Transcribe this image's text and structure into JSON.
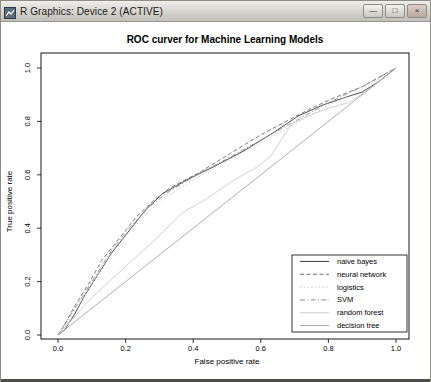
{
  "window": {
    "title": "R Graphics: Device 2 (ACTIVE)",
    "controls": [
      {
        "name": "minimize",
        "glyph": "—"
      },
      {
        "name": "maximize",
        "glyph": "□"
      },
      {
        "name": "close",
        "glyph": "×"
      }
    ]
  },
  "chart_data": {
    "type": "line",
    "title": "ROC curver for Machine Learning Models",
    "xlabel": "False positive rate",
    "ylabel": "True positive rate",
    "xlim": [
      0,
      1
    ],
    "ylim": [
      0,
      1
    ],
    "xticks": [
      "0.0",
      "0.2",
      "0.4",
      "0.6",
      "0.8",
      "1.0"
    ],
    "yticks": [
      "0.0",
      "0.2",
      "0.4",
      "0.6",
      "0.8",
      "1.0"
    ],
    "grid": false,
    "legend_position": "bottom-right",
    "axis_color": "#000000",
    "series": [
      {
        "name": "naive bayes",
        "color": "#3c3c3c",
        "dash": "",
        "points": [
          [
            0,
            0
          ],
          [
            0.02,
            0.02
          ],
          [
            0.05,
            0.08
          ],
          [
            0.08,
            0.15
          ],
          [
            0.12,
            0.23
          ],
          [
            0.16,
            0.31
          ],
          [
            0.21,
            0.39
          ],
          [
            0.26,
            0.47
          ],
          [
            0.31,
            0.53
          ],
          [
            0.38,
            0.58
          ],
          [
            0.46,
            0.63
          ],
          [
            0.55,
            0.69
          ],
          [
            0.64,
            0.76
          ],
          [
            0.71,
            0.82
          ],
          [
            0.78,
            0.86
          ],
          [
            0.85,
            0.89
          ],
          [
            0.9,
            0.91
          ],
          [
            0.95,
            0.95
          ],
          [
            1,
            1
          ]
        ]
      },
      {
        "name": "neural network",
        "color": "#6e6e6e",
        "dash": "4 2.5",
        "points": [
          [
            0,
            0
          ],
          [
            0.02,
            0.04
          ],
          [
            0.05,
            0.11
          ],
          [
            0.09,
            0.19
          ],
          [
            0.13,
            0.28
          ],
          [
            0.18,
            0.36
          ],
          [
            0.23,
            0.44
          ],
          [
            0.28,
            0.5
          ],
          [
            0.33,
            0.55
          ],
          [
            0.42,
            0.61
          ],
          [
            0.51,
            0.68
          ],
          [
            0.6,
            0.75
          ],
          [
            0.69,
            0.81
          ],
          [
            0.75,
            0.85
          ],
          [
            0.82,
            0.89
          ],
          [
            0.9,
            0.93
          ],
          [
            1,
            1
          ]
        ]
      },
      {
        "name": "logistics",
        "color": "#c8c8c8",
        "dash": "1.5 2.2",
        "points": [
          [
            0,
            0
          ],
          [
            0.03,
            0.05
          ],
          [
            0.06,
            0.11
          ],
          [
            0.1,
            0.19
          ],
          [
            0.15,
            0.29
          ],
          [
            0.2,
            0.37
          ],
          [
            0.26,
            0.45
          ],
          [
            0.31,
            0.51
          ],
          [
            0.4,
            0.58
          ],
          [
            0.5,
            0.65
          ],
          [
            0.6,
            0.72
          ],
          [
            0.7,
            0.79
          ],
          [
            0.8,
            0.86
          ],
          [
            0.9,
            0.92
          ],
          [
            1,
            1
          ]
        ]
      },
      {
        "name": "SVM",
        "color": "#8f8f8f",
        "dash": "5 2.2 1.2 2.2",
        "points": [
          [
            0,
            0
          ],
          [
            0.03,
            0.06
          ],
          [
            0.07,
            0.14
          ],
          [
            0.11,
            0.22
          ],
          [
            0.16,
            0.32
          ],
          [
            0.21,
            0.4
          ],
          [
            0.27,
            0.48
          ],
          [
            0.32,
            0.53
          ],
          [
            0.41,
            0.6
          ],
          [
            0.5,
            0.66
          ],
          [
            0.6,
            0.73
          ],
          [
            0.7,
            0.8
          ],
          [
            0.8,
            0.87
          ],
          [
            0.9,
            0.93
          ],
          [
            1,
            1
          ]
        ]
      },
      {
        "name": "random forest",
        "color": "#cccccc",
        "dash": "",
        "points": [
          [
            0,
            0
          ],
          [
            0.05,
            0.07
          ],
          [
            0.1,
            0.14
          ],
          [
            0.16,
            0.21
          ],
          [
            0.22,
            0.28
          ],
          [
            0.29,
            0.36
          ],
          [
            0.37,
            0.46
          ],
          [
            0.44,
            0.51
          ],
          [
            0.52,
            0.58
          ],
          [
            0.59,
            0.63
          ],
          [
            0.63,
            0.67
          ],
          [
            0.66,
            0.73
          ],
          [
            0.69,
            0.79
          ],
          [
            0.74,
            0.82
          ],
          [
            0.8,
            0.85
          ],
          [
            0.86,
            0.87
          ],
          [
            0.92,
            0.92
          ],
          [
            1,
            1
          ]
        ]
      },
      {
        "name": "decision tree",
        "color": "#a6a6a6",
        "dash": "",
        "points": [
          [
            0,
            0
          ],
          [
            1,
            1
          ]
        ]
      }
    ]
  }
}
